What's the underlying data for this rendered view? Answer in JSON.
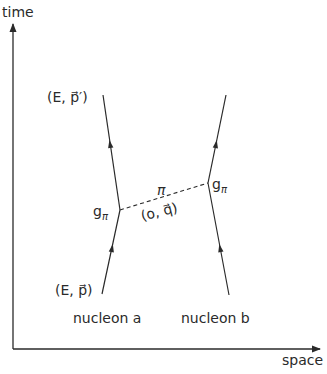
{
  "axes": {
    "y_label": "time",
    "x_label": "space"
  },
  "nucleons": {
    "a": {
      "label": "nucleon a",
      "initial_state": "(E, p⃗)",
      "final_state": "(E, p⃗′)"
    },
    "b": {
      "label": "nucleon b"
    }
  },
  "vertices": {
    "left": {
      "coupling": "g",
      "coupling_sub": "π"
    },
    "right": {
      "coupling": "g",
      "coupling_sub": "π"
    }
  },
  "exchange": {
    "particle": "π",
    "momentum": "(o, q⃗)",
    "line_style": "dashed"
  },
  "colors": {
    "ink": "#2a2a2a",
    "background": "#ffffff"
  }
}
